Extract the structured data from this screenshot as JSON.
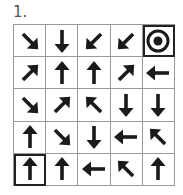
{
  "puzzle": {
    "number_label": "1.",
    "rows": 5,
    "cols": 5,
    "cells": [
      [
        "down-right",
        "down",
        "down-left",
        "down-left",
        "target"
      ],
      [
        "up-right",
        "up",
        "up",
        "up-right",
        "left"
      ],
      [
        "down-right",
        "up-right",
        "up-left",
        "down",
        "down"
      ],
      [
        "up",
        "down-right",
        "down",
        "left",
        "up-left"
      ],
      [
        "up",
        "up",
        "left",
        "up-left",
        "up"
      ]
    ],
    "start_cell": {
      "row": 4,
      "col": 0
    },
    "goal_cell": {
      "row": 0,
      "col": 4
    },
    "colors": {
      "arrow": "#1a1a1a",
      "grid_line": "#999999",
      "highlight_border": "#222222"
    }
  }
}
